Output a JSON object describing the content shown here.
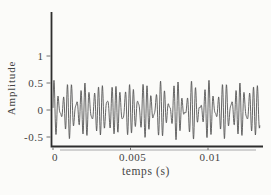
{
  "figure": {
    "kind": "scanned textbook waveform plot",
    "background_color": "#fbfbf9"
  },
  "chart_data": {
    "type": "line",
    "title": "",
    "xlabel": "temps (s)",
    "ylabel": "Amplitude",
    "legend": null,
    "grid": false,
    "xlim": [
      0,
      0.01335
    ],
    "ylim": [
      -0.67,
      1.82
    ],
    "x_ticks": [
      {
        "value": 0,
        "label": "0"
      },
      {
        "value": 0.005,
        "label": "0.005"
      },
      {
        "value": 0.01,
        "label": "0.01"
      }
    ],
    "y_ticks": [
      {
        "value": 1,
        "label": "1"
      },
      {
        "value": 0.5,
        "label": "0.5"
      },
      {
        "value": 0,
        "label": "0"
      },
      {
        "value": -0.5,
        "label": "-0.5"
      }
    ],
    "series": [
      {
        "name": "signal",
        "description": "sum of sinusoids producing beats, amplitude approx. -0.5 to +0.55",
        "components": [
          {
            "amplitude": 0.3,
            "frequency_hz": 3500,
            "phase_rad": 0
          },
          {
            "amplitude": 0.2,
            "frequency_hz": 4500,
            "phase_rad": 0
          },
          {
            "amplitude": 0.06,
            "frequency_hz": 2600,
            "phase_rad": 0.7
          }
        ],
        "duration_s": 0.01335,
        "sample_step_s": 1.6e-05
      }
    ],
    "colors": {
      "axis": "#2e2e2e",
      "trace": "#565656",
      "tick_label": "#3f3f3f",
      "axis_shadow": "#c3c3c3",
      "background": "#fbfbf9"
    }
  }
}
